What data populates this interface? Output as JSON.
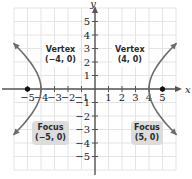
{
  "chart_data": {
    "type": "line",
    "title": "",
    "equation": "x^2/16 - y^2/9 = 1",
    "xlabel": "x",
    "ylabel": "y",
    "xlim": [
      -6,
      6
    ],
    "ylim": [
      -6,
      6
    ],
    "grid": true,
    "x_ticks": [
      -5,
      -4,
      -3,
      -2,
      -1,
      1,
      2,
      3,
      4,
      5
    ],
    "y_ticks": [
      -5,
      -4,
      -3,
      -2,
      -1,
      1,
      2,
      3,
      4,
      5
    ],
    "x_tick_labels": [
      "−5",
      "−4",
      "−3",
      "−2",
      "−1",
      "1",
      "2",
      "3",
      "4",
      "5"
    ],
    "y_tick_labels": [
      "−5",
      "−4",
      "−3",
      "−2",
      "−1",
      "1",
      "2",
      "3",
      "4",
      "5"
    ],
    "series": [
      {
        "name": "left branch",
        "a": 4,
        "b": 3,
        "branch": -1,
        "y_range": [
          -3.4,
          3.4
        ]
      },
      {
        "name": "right branch",
        "a": 4,
        "b": 3,
        "branch": 1,
        "y_range": [
          -3.4,
          3.4
        ]
      }
    ],
    "points": [
      {
        "name": "focus-left",
        "x": -5,
        "y": 0
      },
      {
        "name": "focus-right",
        "x": 5,
        "y": 0
      }
    ],
    "annotations": [
      {
        "id": "vertex-left",
        "title": "Vertex",
        "coords": "(−4, 0)",
        "x": -4,
        "y": 0
      },
      {
        "id": "vertex-right",
        "title": "Vertex",
        "coords": "(4, 0)",
        "x": 4,
        "y": 0
      },
      {
        "id": "focus-left",
        "title": "Focus",
        "coords": "(−5, 0)",
        "x": -5,
        "y": 0
      },
      {
        "id": "focus-right",
        "title": "Focus",
        "coords": "(5, 0)",
        "x": 5,
        "y": 0
      }
    ],
    "colors": {
      "curve": "#6b6b6b",
      "axis": "#555555",
      "grid": "#e4e4e4",
      "point": "#111111",
      "focus_box": "#dcdcdc"
    }
  },
  "labels": {
    "vertex_left": {
      "title": "Vertex",
      "coords": "(−4, 0)"
    },
    "vertex_right": {
      "title": "Vertex",
      "coords": "(4, 0)"
    },
    "focus_left": {
      "title": "Focus",
      "coords": "(−5, 0)"
    },
    "focus_right": {
      "title": "Focus",
      "coords": "(5, 0)"
    }
  }
}
